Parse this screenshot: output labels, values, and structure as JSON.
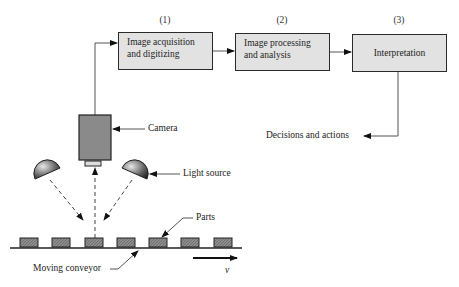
{
  "diagram": {
    "stages": [
      {
        "number": "(1)",
        "label_line1": "Image acquisition",
        "label_line2": "and digitizing"
      },
      {
        "number": "(2)",
        "label_line1": "Image processing",
        "label_line2": "and analysis"
      },
      {
        "number": "(3)",
        "label": "Interpretation"
      }
    ],
    "labels": {
      "camera": "Camera",
      "light_source": "Light source",
      "parts": "Parts",
      "conveyor": "Moving conveyor",
      "velocity": "v",
      "output": "Decisions and actions"
    },
    "parts_count": 7,
    "colors": {
      "box_fill": "#e2e2e2",
      "camera_fill": "#8a8a8a",
      "part_fill": "#8c8c8c",
      "line": "#2a2a2a"
    }
  }
}
